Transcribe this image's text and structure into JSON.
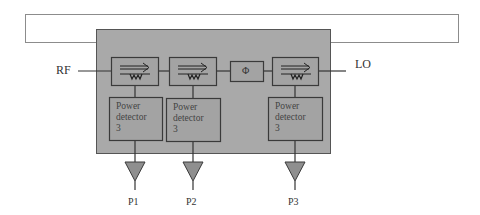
{
  "diagram": {
    "ports": {
      "rf_label": "RF",
      "lo_label": "LO"
    },
    "phase_shifter": {
      "symbol": "Φ"
    },
    "couplers": [
      {
        "id": "coupler-1",
        "icon": "directional-coupler-icon"
      },
      {
        "id": "coupler-2",
        "icon": "directional-coupler-icon"
      },
      {
        "id": "coupler-3",
        "icon": "directional-coupler-icon"
      }
    ],
    "detectors": [
      {
        "line1": "Power",
        "line2": "detector",
        "line3": "3"
      },
      {
        "line1": "Power",
        "line2": "detector",
        "line3": "3"
      },
      {
        "line1": "Power",
        "line2": "detector",
        "line3": "3"
      }
    ],
    "outputs": [
      {
        "label": "P1"
      },
      {
        "label": "P2"
      },
      {
        "label": "P3"
      }
    ],
    "colors": {
      "module_fill": "#a9a9a9",
      "block_fill": "#a3a3a3",
      "stroke": "#3a3a3a",
      "frame": "#8c8c8c",
      "amp_fill": "#8f8f8f"
    }
  }
}
